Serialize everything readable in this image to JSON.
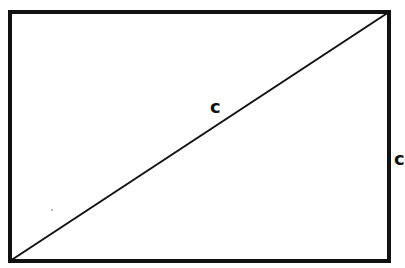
{
  "diagram": {
    "type": "rectangle-with-diagonal",
    "stroke_color": "#111111",
    "background": "#ffffff",
    "rectangle": {
      "x": 10,
      "y": 12,
      "width": 379,
      "height": 249,
      "stroke_width": 4
    },
    "diagonal": {
      "x1": 10,
      "y1": 261,
      "x2": 389,
      "y2": 12,
      "stroke_width": 2
    },
    "labels": {
      "diagonal": "c",
      "right_side_partial": "c"
    },
    "speck": {
      "cx": 52,
      "cy": 210
    }
  }
}
